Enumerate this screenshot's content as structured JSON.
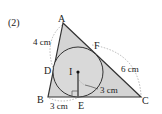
{
  "problem_number": "(2)",
  "points": {
    "A": {
      "label": "A",
      "x": 63,
      "y": 23
    },
    "B": {
      "label": "B",
      "x": 48,
      "y": 97
    },
    "C": {
      "label": "C",
      "x": 141,
      "y": 97
    },
    "D": {
      "label": "D",
      "x": 54,
      "y": 70
    },
    "E": {
      "label": "E",
      "x": 78,
      "y": 97
    },
    "F": {
      "label": "F",
      "x": 90,
      "y": 45
    },
    "I": {
      "label": "I",
      "x": 78,
      "y": 72
    }
  },
  "incircle": {
    "cx": 78,
    "cy": 72,
    "r": 25
  },
  "measurements": {
    "AD": "4 cm",
    "BE": "3 cm",
    "FC": "6 cm",
    "radius": "3 cm"
  },
  "colors": {
    "fill": "#d4d4d4",
    "stroke": "#333333",
    "dashed": "#888888"
  }
}
